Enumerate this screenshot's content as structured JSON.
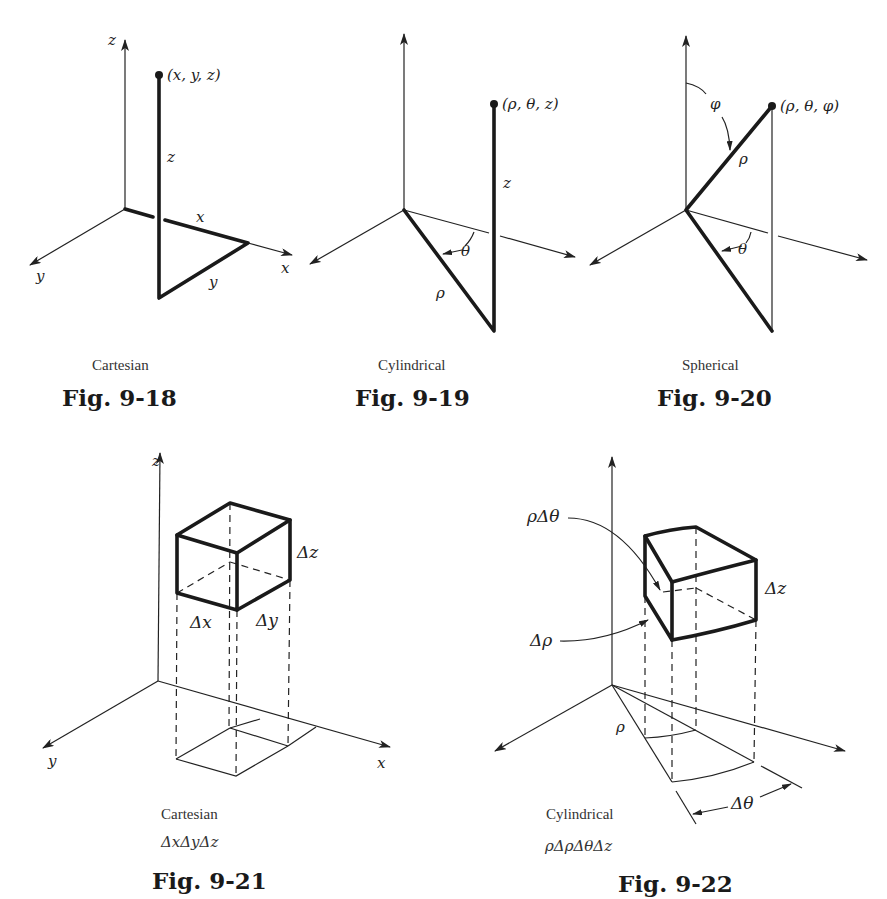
{
  "figures": [
    {
      "id": "fig-9-18",
      "caption": "Cartesian",
      "number": "Fig. 9-18",
      "labels": {
        "z_axis": "z",
        "x_axis": "x",
        "y_axis": "y",
        "point": "(x, y, z)",
        "z_seg": "z",
        "x_seg": "x",
        "y_seg": "y"
      }
    },
    {
      "id": "fig-9-19",
      "caption": "Cylindrical",
      "number": "Fig. 9-19",
      "labels": {
        "point": "(ρ, θ, z)",
        "z_seg": "z",
        "theta": "θ",
        "rho": "ρ"
      }
    },
    {
      "id": "fig-9-20",
      "caption": "Spherical",
      "number": "Fig. 9-20",
      "labels": {
        "point": "(ρ, θ, φ)",
        "phi": "φ",
        "rho": "ρ",
        "theta": "θ"
      }
    },
    {
      "id": "fig-9-21",
      "caption": "Cartesian",
      "formula": "ΔxΔyΔz",
      "number": "Fig. 9-21",
      "labels": {
        "z_axis": "z",
        "x_axis": "x",
        "y_axis": "y",
        "dx": "Δx",
        "dy": "Δy",
        "dz": "Δz"
      }
    },
    {
      "id": "fig-9-22",
      "caption": "Cylindrical",
      "formula": "ρΔρΔθΔz",
      "number": "Fig. 9-22",
      "labels": {
        "rho_dtheta": "ρΔθ",
        "drho": "Δρ",
        "dz": "Δz",
        "rho": "ρ",
        "dtheta": "Δθ"
      }
    }
  ]
}
